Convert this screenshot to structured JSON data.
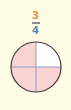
{
  "fraction": {
    "numerator": "3",
    "denominator": "4"
  },
  "diagram": {
    "type": "fraction-circle",
    "parts": 4,
    "shaded_parts": 3,
    "shaded_color": "#f7d3d3",
    "unshaded_color": "#ffffff",
    "outline_color": "#4a3a3a",
    "divider_color": "#9a9ac0"
  },
  "colors": {
    "background": "#fdfbe3",
    "numerator": "#f08a4b",
    "denominator": "#5b8fb3"
  }
}
